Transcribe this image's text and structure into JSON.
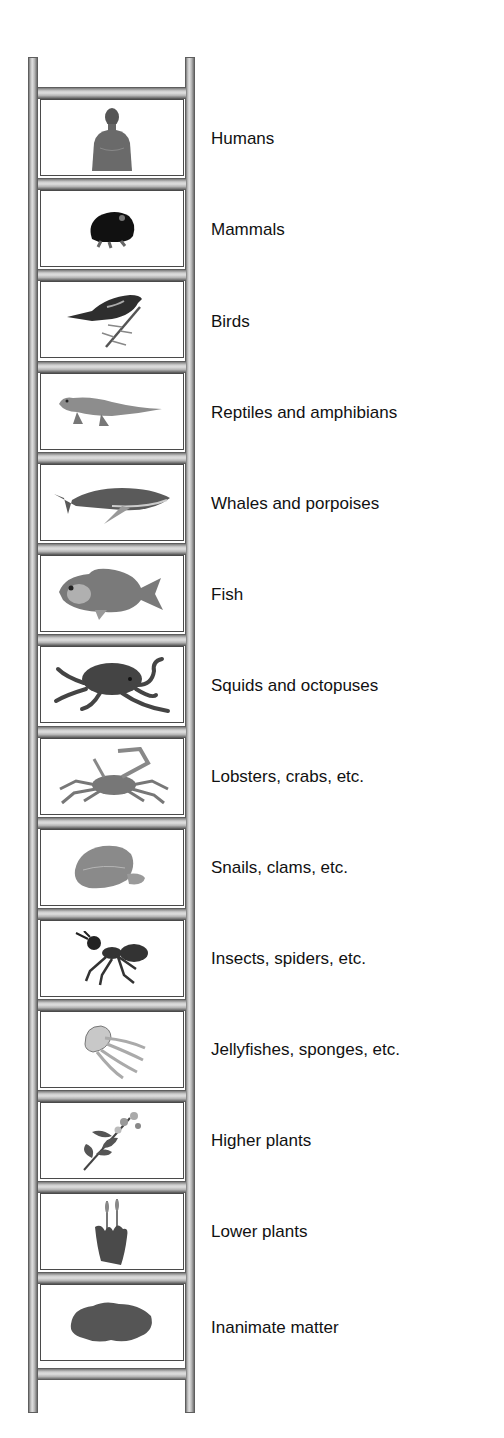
{
  "diagram": {
    "type": "scala-naturae-ladder",
    "colors": {
      "rail": "#bdbdbd",
      "rail_edge": "#5e5e5e",
      "panel_border": "#4a4a4a",
      "label_text": "#111111",
      "illustration": "#3a3a3a"
    },
    "rungs": [
      {
        "label": "Humans",
        "icon": "human-torso-icon"
      },
      {
        "label": "Mammals",
        "icon": "mole-icon"
      },
      {
        "label": "Birds",
        "icon": "bird-on-branch-icon"
      },
      {
        "label": "Reptiles and amphibians",
        "icon": "lizard-icon"
      },
      {
        "label": "Whales and porpoises",
        "icon": "whale-icon"
      },
      {
        "label": "Fish",
        "icon": "fish-icon"
      },
      {
        "label": "Squids and octopuses",
        "icon": "octopus-icon"
      },
      {
        "label": "Lobsters, crabs, etc.",
        "icon": "crab-icon"
      },
      {
        "label": "Snails, clams, etc.",
        "icon": "clam-icon"
      },
      {
        "label": "Insects, spiders, etc.",
        "icon": "ant-icon"
      },
      {
        "label": "Jellyfishes, sponges, etc.",
        "icon": "jellyfish-icon"
      },
      {
        "label": "Higher plants",
        "icon": "flowering-plant-icon"
      },
      {
        "label": "Lower plants",
        "icon": "moss-icon"
      },
      {
        "label": "Inanimate matter",
        "icon": "rock-icon"
      }
    ]
  }
}
